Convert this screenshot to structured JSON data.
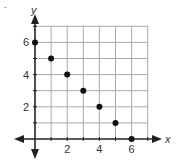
{
  "chart_data": {
    "type": "scatter",
    "title": "",
    "xlabel": "x",
    "ylabel": "y",
    "x": [
      0,
      1,
      2,
      3,
      4,
      5,
      6
    ],
    "y": [
      6,
      5,
      4,
      3,
      2,
      1,
      0
    ],
    "xticks": [
      "2",
      "4",
      "6"
    ],
    "yticks": [
      "2",
      "4",
      "6"
    ],
    "xlim": [
      0,
      7
    ],
    "ylim": [
      0,
      7
    ],
    "grid": true,
    "legend": null
  },
  "labels": {
    "x_axis": "x",
    "y_axis": "y",
    "marker": "."
  }
}
